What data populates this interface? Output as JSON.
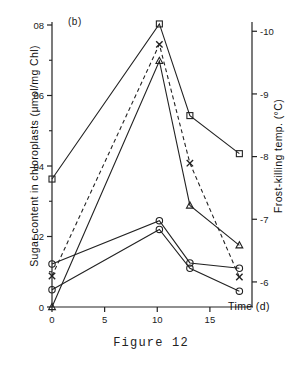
{
  "figure": {
    "caption": "Figure 12",
    "panel_label": "(b)"
  },
  "chart_data": {
    "type": "line",
    "title": "",
    "subtitle": "",
    "panel": "(b)",
    "xlabel": "Time (d)",
    "ylabel": "Sugar content in chloroplasts (μmol/mg Chl)",
    "y2label": "Frost-killing temp. (°C)",
    "xlim": [
      0,
      19
    ],
    "ylim": [
      0,
      0.8
    ],
    "y2lim": [
      -5.6,
      -10.1
    ],
    "grid": false,
    "legend": "none",
    "xticks": [
      0,
      5,
      10,
      15
    ],
    "xticklabels": [
      "0",
      "5",
      "10",
      "15"
    ],
    "yticks": [
      0,
      0.2,
      0.4,
      0.6,
      0.8
    ],
    "yticklabels": [
      "0",
      "02",
      "04",
      "06",
      "08"
    ],
    "yticks_minor": [
      0.1,
      0.3,
      0.5,
      0.7
    ],
    "y2ticks": [
      -6,
      -7,
      -8,
      -9,
      -10
    ],
    "y2ticklabels": [
      "-6",
      "-7",
      "-8",
      "-9",
      "-10"
    ],
    "series": [
      {
        "name": "frost-killing temperature",
        "marker": "square",
        "linestyle": "solid",
        "axis": "right",
        "x": [
          0,
          10.2,
          13.1,
          17.8
        ],
        "values": [
          0.363,
          0.803,
          0.543,
          0.435
        ],
        "values_right_axis": [
          -7.03,
          -9.98,
          -8.24,
          -7.51
        ]
      },
      {
        "name": "sugar series x",
        "marker": "cross",
        "linestyle": "dashed",
        "axis": "left",
        "x": [
          0,
          10.2,
          13.1,
          17.8
        ],
        "values": [
          0.088,
          0.745,
          0.408,
          0.085
        ]
      },
      {
        "name": "sugar series triangle",
        "marker": "triangle",
        "linestyle": "solid",
        "axis": "left",
        "x": [
          0,
          10.2,
          13.1,
          17.8
        ],
        "values": [
          0.0,
          0.698,
          0.288,
          0.175
        ]
      },
      {
        "name": "sugar series circle upper",
        "marker": "circle",
        "linestyle": "solid",
        "axis": "left",
        "x": [
          0,
          10.2,
          13.1,
          17.8
        ],
        "values": [
          0.122,
          0.245,
          0.125,
          0.11
        ]
      },
      {
        "name": "sugar series circle lower",
        "marker": "circle",
        "linestyle": "solid",
        "axis": "left",
        "x": [
          0,
          10.2,
          13.1,
          17.8
        ],
        "values": [
          0.049,
          0.22,
          0.11,
          0.045
        ]
      }
    ]
  }
}
